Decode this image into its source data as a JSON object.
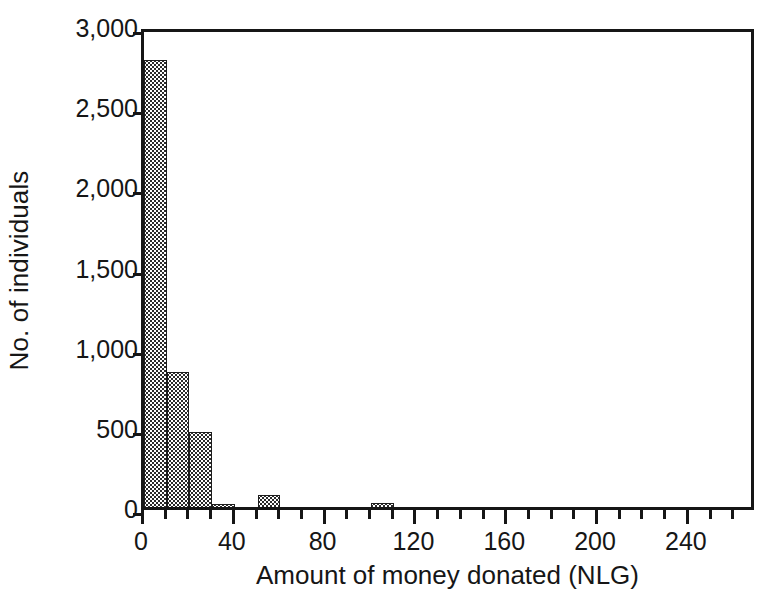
{
  "chart_data": {
    "type": "bar",
    "title": "",
    "subtitle": "",
    "xlabel": "Amount of money donated (NLG)",
    "ylabel": "No. of individuals",
    "xlim": [
      0,
      270
    ],
    "ylim": [
      0,
      3000
    ],
    "grid": false,
    "legend": null,
    "bin_width": 10,
    "categories": [
      "0-10",
      "10-20",
      "20-30",
      "30-40",
      "50-60",
      "100-110"
    ],
    "bin_starts": [
      0,
      10,
      20,
      30,
      50,
      100
    ],
    "values": [
      2790,
      840,
      465,
      20,
      75,
      25
    ],
    "xticks_major": [
      0,
      40,
      80,
      120,
      160,
      200,
      240
    ],
    "xtick_labels": [
      "0",
      "40",
      "80",
      "120",
      "160",
      "200",
      "240"
    ],
    "xticks_minor": [
      10,
      20,
      30,
      50,
      60,
      70,
      90,
      100,
      110,
      130,
      140,
      150,
      170,
      180,
      190,
      210,
      220,
      230,
      250,
      260
    ],
    "yticks": [
      0,
      500,
      1000,
      1500,
      2000,
      2500,
      3000
    ],
    "ytick_labels": [
      "0",
      "500",
      "1,000",
      "1,500",
      "2,000",
      "2,500",
      "3,000"
    ],
    "colors": {
      "bar_fill": "#2b2b2b",
      "bar_dot": "#ffffff",
      "axis": "#161616",
      "background": "#ffffff",
      "text": "#161616"
    }
  }
}
